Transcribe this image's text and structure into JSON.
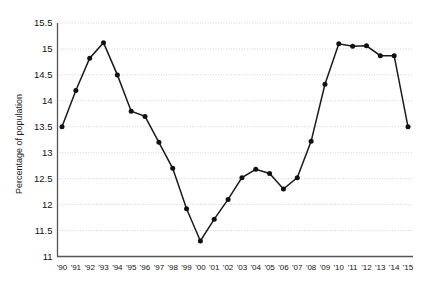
{
  "chart_data": {
    "type": "line",
    "title": "",
    "xlabel": "",
    "ylabel": "Percentage of population",
    "ylim": [
      11,
      15.5
    ],
    "yticks": [
      11,
      11.5,
      12,
      12.5,
      13,
      13.5,
      14,
      14.5,
      15,
      15.5
    ],
    "ytick_labels": [
      "11",
      "11.5",
      "12",
      "12.5",
      "13",
      "13.5",
      "14",
      "14.5",
      "15",
      "15.5"
    ],
    "grid": true,
    "legend": "none",
    "marker": "filled-circle",
    "line_color": "#1a1a1a",
    "grid_color": "#bdbdbd",
    "categories": [
      "'90",
      "'91",
      "'92",
      "'93",
      "'94",
      "'95",
      "'96",
      "'97",
      "'98",
      "'99",
      "'00",
      "'01",
      "'02",
      "'03",
      "'04",
      "'05",
      "'06",
      "'07",
      "'08",
      "'09",
      "'10",
      "'11",
      "'12",
      "'13",
      "'14",
      "'15"
    ],
    "values": [
      13.5,
      14.2,
      14.82,
      15.12,
      14.5,
      13.8,
      13.7,
      13.2,
      12.7,
      11.92,
      11.3,
      11.72,
      12.1,
      12.52,
      12.68,
      12.6,
      12.3,
      12.52,
      13.22,
      14.32,
      15.1,
      15.05,
      15.06,
      14.87,
      14.87,
      13.5
    ]
  }
}
